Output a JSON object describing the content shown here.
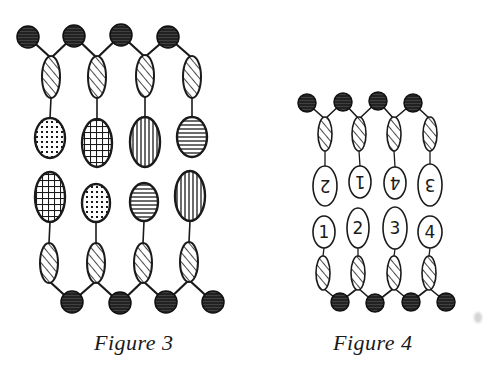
{
  "colors": {
    "ink": "#1a1a1a",
    "paper": "#ffffff",
    "ball_fill": "#2a2a2a"
  },
  "figures": [
    {
      "id": "figure-3",
      "caption": "Figure 3",
      "top_heads": [
        {
          "cx": 28,
          "cy": 37,
          "r": 11
        },
        {
          "cx": 74,
          "cy": 36,
          "r": 11
        },
        {
          "cx": 121,
          "cy": 35,
          "r": 11
        },
        {
          "cx": 168,
          "cy": 37,
          "r": 11
        }
      ],
      "top_tails": [
        {
          "cx": 51,
          "cy": 77,
          "rx": 9,
          "ry": 21
        },
        {
          "cx": 97,
          "cy": 77,
          "rx": 9,
          "ry": 21
        },
        {
          "cx": 145,
          "cy": 76,
          "rx": 9,
          "ry": 21
        },
        {
          "cx": 192,
          "cy": 77,
          "rx": 9,
          "ry": 21
        }
      ],
      "upper_groups": [
        {
          "cx": 50,
          "cy": 138,
          "rx": 15,
          "ry": 20,
          "pattern": "dots"
        },
        {
          "cx": 97,
          "cy": 143,
          "rx": 15,
          "ry": 24,
          "pattern": "grid"
        },
        {
          "cx": 145,
          "cy": 142,
          "rx": 15,
          "ry": 25,
          "pattern": "vertical"
        },
        {
          "cx": 192,
          "cy": 137,
          "rx": 15,
          "ry": 20,
          "pattern": "horizontal"
        }
      ],
      "lower_groups": [
        {
          "cx": 50,
          "cy": 197,
          "rx": 15,
          "ry": 25,
          "pattern": "grid"
        },
        {
          "cx": 96,
          "cy": 203,
          "rx": 14,
          "ry": 19,
          "pattern": "dots"
        },
        {
          "cx": 144,
          "cy": 202,
          "rx": 14,
          "ry": 19,
          "pattern": "horizontal"
        },
        {
          "cx": 190,
          "cy": 196,
          "rx": 15,
          "ry": 25,
          "pattern": "vertical"
        }
      ],
      "bottom_tails": [
        {
          "cx": 49,
          "cy": 263,
          "rx": 9,
          "ry": 20
        },
        {
          "cx": 96,
          "cy": 263,
          "rx": 9,
          "ry": 20
        },
        {
          "cx": 143,
          "cy": 263,
          "rx": 9,
          "ry": 20
        },
        {
          "cx": 189,
          "cy": 262,
          "rx": 9,
          "ry": 20
        }
      ],
      "bottom_heads": [
        {
          "cx": 72,
          "cy": 302,
          "r": 11
        },
        {
          "cx": 120,
          "cy": 303,
          "r": 11
        },
        {
          "cx": 166,
          "cy": 302,
          "r": 11
        },
        {
          "cx": 213,
          "cy": 302,
          "r": 11
        }
      ]
    },
    {
      "id": "figure-4",
      "caption": "Figure 4",
      "top_heads": [
        {
          "cx": 307,
          "cy": 103,
          "r": 9
        },
        {
          "cx": 343,
          "cy": 102,
          "r": 9
        },
        {
          "cx": 378,
          "cy": 101,
          "r": 9
        },
        {
          "cx": 413,
          "cy": 103,
          "r": 9
        }
      ],
      "top_tails": [
        {
          "cx": 325,
          "cy": 134,
          "rx": 7,
          "ry": 17
        },
        {
          "cx": 359,
          "cy": 134,
          "rx": 7,
          "ry": 17
        },
        {
          "cx": 394,
          "cy": 134,
          "rx": 7,
          "ry": 17
        },
        {
          "cx": 430,
          "cy": 134,
          "rx": 7,
          "ry": 17
        }
      ],
      "upper_groups": [
        {
          "cx": 325,
          "cy": 186,
          "rx": 12,
          "ry": 20,
          "label": "2",
          "inverted": true
        },
        {
          "cx": 360,
          "cy": 182,
          "rx": 11,
          "ry": 16,
          "label": "1",
          "inverted": true
        },
        {
          "cx": 395,
          "cy": 183,
          "rx": 11,
          "ry": 16,
          "label": "4",
          "inverted": true
        },
        {
          "cx": 430,
          "cy": 185,
          "rx": 12,
          "ry": 21,
          "label": "3",
          "inverted": true
        }
      ],
      "lower_groups": [
        {
          "cx": 324,
          "cy": 232,
          "rx": 11,
          "ry": 16,
          "label": "1",
          "inverted": false
        },
        {
          "cx": 358,
          "cy": 228,
          "rx": 11,
          "ry": 20,
          "label": "2",
          "inverted": false
        },
        {
          "cx": 395,
          "cy": 228,
          "rx": 12,
          "ry": 21,
          "label": "3",
          "inverted": false
        },
        {
          "cx": 430,
          "cy": 232,
          "rx": 12,
          "ry": 16,
          "label": "4",
          "inverted": false
        }
      ],
      "bottom_tails": [
        {
          "cx": 323,
          "cy": 273,
          "rx": 7,
          "ry": 17
        },
        {
          "cx": 358,
          "cy": 273,
          "rx": 7,
          "ry": 17
        },
        {
          "cx": 394,
          "cy": 273,
          "rx": 7,
          "ry": 17
        },
        {
          "cx": 429,
          "cy": 273,
          "rx": 7,
          "ry": 17
        }
      ],
      "bottom_heads": [
        {
          "cx": 340,
          "cy": 302,
          "r": 9
        },
        {
          "cx": 375,
          "cy": 303,
          "r": 9
        },
        {
          "cx": 411,
          "cy": 302,
          "r": 9
        },
        {
          "cx": 446,
          "cy": 302,
          "r": 9
        }
      ]
    }
  ]
}
